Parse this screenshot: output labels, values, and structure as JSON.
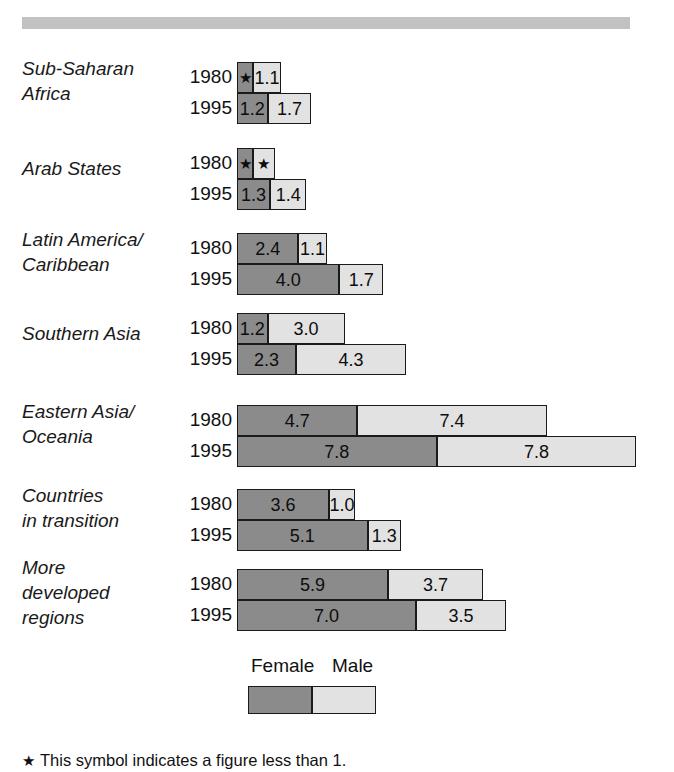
{
  "figure": {
    "top_rule_color": "#c2c2c2",
    "footnote": "This symbol indicates a figure less than 1.",
    "footnote_symbol": "★"
  },
  "legend": {
    "female_label": "Female",
    "male_label": "Male",
    "female_color": "#8b8b8b",
    "male_color": "#e2e2e2"
  },
  "chart_data": {
    "type": "bar",
    "orientation": "horizontal",
    "stacked": true,
    "title": "",
    "xlabel": "",
    "ylabel": "",
    "grid": false,
    "legend_position": "bottom-center",
    "series": [
      {
        "name": "Female",
        "color": "#8b8b8b"
      },
      {
        "name": "Male",
        "color": "#e2e2e2"
      }
    ],
    "units_per_pixel": 0.0391,
    "pixels_per_unit": 25.6,
    "below_one_symbol": "★",
    "categories": [
      "Sub-Saharan Africa",
      "Arab States",
      "Latin America/Caribbean",
      "Southern Asia",
      "Eastern Asia/Oceania",
      "Countries in transition",
      "More developed regions"
    ],
    "groups": [
      {
        "label": "Sub-Saharan\nAfrica",
        "label_lines": [
          "Sub-Saharan",
          "Africa"
        ],
        "rows": [
          {
            "year": "1980",
            "female": 0.6,
            "female_text": "★",
            "female_below_one": true,
            "male": 1.1,
            "male_text": "1.1",
            "male_below_one": false
          },
          {
            "year": "1995",
            "female": 1.2,
            "female_text": "1.2",
            "female_below_one": false,
            "male": 1.7,
            "male_text": "1.7",
            "male_below_one": false
          }
        ]
      },
      {
        "label": "Arab States",
        "label_lines": [
          "Arab States"
        ],
        "rows": [
          {
            "year": "1980",
            "female": 0.6,
            "female_text": "★",
            "female_below_one": true,
            "male": 0.85,
            "male_text": "★",
            "male_below_one": true
          },
          {
            "year": "1995",
            "female": 1.3,
            "female_text": "1.3",
            "female_below_one": false,
            "male": 1.4,
            "male_text": "1.4",
            "male_below_one": false
          }
        ]
      },
      {
        "label": "Latin America/\nCaribbean",
        "label_lines": [
          "Latin America/",
          "Caribbean"
        ],
        "rows": [
          {
            "year": "1980",
            "female": 2.4,
            "female_text": "2.4",
            "female_below_one": false,
            "male": 1.1,
            "male_text": "1.1",
            "male_below_one": false
          },
          {
            "year": "1995",
            "female": 4.0,
            "female_text": "4.0",
            "female_below_one": false,
            "male": 1.7,
            "male_text": "1.7",
            "male_below_one": false
          }
        ]
      },
      {
        "label": "Southern Asia",
        "label_lines": [
          "Southern Asia"
        ],
        "rows": [
          {
            "year": "1980",
            "female": 1.2,
            "female_text": "1.2",
            "female_below_one": false,
            "male": 3.0,
            "male_text": "3.0",
            "male_below_one": false
          },
          {
            "year": "1995",
            "female": 2.3,
            "female_text": "2.3",
            "female_below_one": false,
            "male": 4.3,
            "male_text": "4.3",
            "male_below_one": false
          }
        ]
      },
      {
        "label": "Eastern Asia/\nOceania",
        "label_lines": [
          "Eastern Asia/",
          "Oceania"
        ],
        "rows": [
          {
            "year": "1980",
            "female": 4.7,
            "female_text": "4.7",
            "female_below_one": false,
            "male": 7.4,
            "male_text": "7.4",
            "male_below_one": false
          },
          {
            "year": "1995",
            "female": 7.8,
            "female_text": "7.8",
            "female_below_one": false,
            "male": 7.8,
            "male_text": "7.8",
            "male_below_one": false
          }
        ]
      },
      {
        "label": "Countries\nin transition",
        "label_lines": [
          "Countries",
          "in transition"
        ],
        "rows": [
          {
            "year": "1980",
            "female": 3.6,
            "female_text": "3.6",
            "female_below_one": false,
            "male": 1.0,
            "male_text": "1.0",
            "male_below_one": false
          },
          {
            "year": "1995",
            "female": 5.1,
            "female_text": "5.1",
            "female_below_one": false,
            "male": 1.3,
            "male_text": "1.3",
            "male_below_one": false
          }
        ]
      },
      {
        "label": "More\ndeveloped\nregions",
        "label_lines": [
          "More",
          "developed",
          "regions"
        ],
        "rows": [
          {
            "year": "1980",
            "female": 5.9,
            "female_text": "5.9",
            "female_below_one": false,
            "male": 3.7,
            "male_text": "3.7",
            "male_below_one": false
          },
          {
            "year": "1995",
            "female": 7.0,
            "female_text": "7.0",
            "female_below_one": false,
            "male": 3.5,
            "male_text": "3.5",
            "male_below_one": false
          }
        ]
      }
    ]
  }
}
